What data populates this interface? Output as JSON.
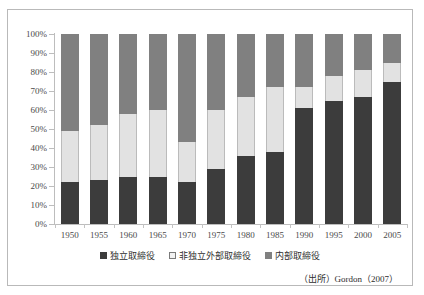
{
  "top_caption": "",
  "source_note": "（出所）Gordon（2007）",
  "legend": {
    "items": [
      {
        "label": "独立取締役",
        "key": "independent",
        "color": "#3c3c3c"
      },
      {
        "label": "非独立外部取締役",
        "key": "nonindependent_outside",
        "color": "#f2f2f2"
      },
      {
        "label": "内部取締役",
        "key": "inside",
        "color": "#808080"
      }
    ]
  },
  "chart_data": {
    "type": "bar",
    "stacked": true,
    "title": "",
    "xlabel": "",
    "ylabel": "",
    "ylim": [
      0,
      100
    ],
    "grid": false,
    "legend_position": "bottom",
    "categories": [
      "1950",
      "1955",
      "1960",
      "1965",
      "1970",
      "1975",
      "1980",
      "1985",
      "1990",
      "1995",
      "2000",
      "2005"
    ],
    "ytick_labels": [
      "0%",
      "10%",
      "20%",
      "30%",
      "40%",
      "50%",
      "60%",
      "70%",
      "80%",
      "90%",
      "100%"
    ],
    "ytick_values": [
      0,
      10,
      20,
      30,
      40,
      50,
      60,
      70,
      80,
      90,
      100
    ],
    "series": [
      {
        "name": "独立取締役",
        "color": "#3c3c3c",
        "values": [
          22,
          23,
          25,
          25,
          22,
          29,
          36,
          38,
          61,
          65,
          67,
          75
        ]
      },
      {
        "name": "非独立外部取締役",
        "color": "#e2e2e2",
        "values": [
          27,
          29,
          33,
          35,
          21,
          31,
          31,
          34,
          11,
          13,
          14,
          10
        ]
      },
      {
        "name": "内部取締役",
        "color": "#808080",
        "values": [
          51,
          48,
          42,
          40,
          57,
          40,
          33,
          28,
          28,
          22,
          19,
          15
        ]
      }
    ]
  }
}
